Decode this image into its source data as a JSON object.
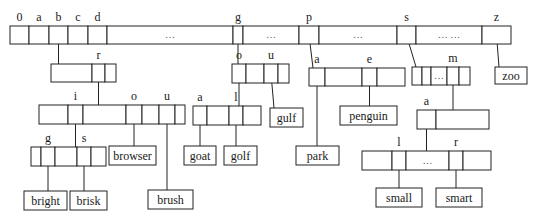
{
  "diagram": {
    "type": "trie",
    "colors": {
      "line": "#222222",
      "text": "#1a1a1a",
      "background": "#ffffff"
    },
    "root": {
      "x": 10,
      "y": 26,
      "h": 18,
      "cells": [
        {
          "label": "0",
          "w": 19
        },
        {
          "label": "a",
          "w": 20
        },
        {
          "label": "b",
          "w": 19,
          "pointer": true
        },
        {
          "label": "c",
          "w": 20
        },
        {
          "label": "d",
          "w": 19
        },
        {
          "label": "",
          "w": 126,
          "dots": "…"
        },
        {
          "label": "g",
          "w": 10,
          "pointer": true
        },
        {
          "label": "",
          "w": 56,
          "dots": "…"
        },
        {
          "label": "p",
          "w": 20,
          "pointer": true
        },
        {
          "label": "",
          "w": 78,
          "dots": "…"
        },
        {
          "label": "s",
          "w": 19,
          "pointer": true
        },
        {
          "label": "",
          "w": 66,
          "dots": "… …"
        },
        {
          "label": "z",
          "w": 29,
          "pointer": true
        }
      ]
    },
    "nodes": [
      {
        "id": "b",
        "x": 51,
        "y": 64,
        "h": 18,
        "cells": [
          {
            "label": "",
            "w": 41
          },
          {
            "label": "r",
            "w": 13,
            "pointer": true
          },
          {
            "label": "",
            "w": 11
          }
        ]
      },
      {
        "id": "br",
        "x": 39,
        "y": 105,
        "h": 19,
        "cells": [
          {
            "label": "",
            "w": 29
          },
          {
            "label": "i",
            "w": 15,
            "pointer": true
          },
          {
            "label": "",
            "w": 43
          },
          {
            "label": "o",
            "w": 16,
            "pointer": true
          },
          {
            "label": "",
            "w": 17
          },
          {
            "label": "u",
            "w": 16,
            "pointer": true
          },
          {
            "label": "",
            "w": 10
          }
        ]
      },
      {
        "id": "bri",
        "x": 31,
        "y": 147,
        "h": 19,
        "cells": [
          {
            "label": "",
            "w": 10
          },
          {
            "label": "g",
            "w": 14,
            "pointer": true
          },
          {
            "label": "",
            "w": 22
          },
          {
            "label": "s",
            "w": 14,
            "pointer": true
          },
          {
            "label": "",
            "w": 15
          }
        ]
      },
      {
        "id": "g",
        "x": 232,
        "y": 64,
        "h": 19,
        "cells": [
          {
            "label": "o",
            "w": 14,
            "pointer": true
          },
          {
            "label": "",
            "w": 18
          },
          {
            "label": "u",
            "w": 14,
            "pointer": true
          },
          {
            "label": "",
            "w": 11
          }
        ]
      },
      {
        "id": "go",
        "x": 193,
        "y": 106,
        "h": 19,
        "cells": [
          {
            "label": "a",
            "w": 14,
            "pointer": true
          },
          {
            "label": "",
            "w": 22
          },
          {
            "label": "l",
            "w": 14,
            "pointer": true
          },
          {
            "label": "",
            "w": 18
          }
        ]
      },
      {
        "id": "p",
        "x": 309,
        "y": 68,
        "h": 18,
        "cells": [
          {
            "label": "a",
            "w": 16,
            "pointer": true
          },
          {
            "label": "",
            "w": 37
          },
          {
            "label": "e",
            "w": 15,
            "pointer": true
          },
          {
            "label": "",
            "w": 28
          }
        ]
      },
      {
        "id": "s",
        "x": 412,
        "y": 67,
        "h": 18,
        "cells": [
          {
            "label": "",
            "w": 10,
            "pointer": true
          },
          {
            "label": "",
            "w": 9
          },
          {
            "label": "",
            "w": 16,
            "dots": "…"
          },
          {
            "label": "m",
            "w": 12,
            "pointer": true
          },
          {
            "label": "",
            "w": 11
          }
        ]
      },
      {
        "id": "sm",
        "x": 417,
        "y": 110,
        "h": 19,
        "cells": [
          {
            "label": "a",
            "w": 19,
            "pointer": true
          },
          {
            "label": "",
            "w": 53
          }
        ]
      },
      {
        "id": "sma",
        "x": 362,
        "y": 151,
        "h": 19,
        "cells": [
          {
            "label": "",
            "w": 30
          },
          {
            "label": "l",
            "w": 14,
            "pointer": true
          },
          {
            "label": "",
            "w": 43,
            "dots": "…"
          },
          {
            "label": "r",
            "w": 14,
            "pointer": true
          },
          {
            "label": "",
            "w": 28
          }
        ]
      }
    ],
    "leaves": [
      {
        "word": "bright",
        "x": 24,
        "y": 191,
        "w": 43,
        "h": 19
      },
      {
        "word": "brisk",
        "x": 70,
        "y": 191,
        "w": 37,
        "h": 19
      },
      {
        "word": "browser",
        "x": 109,
        "y": 146,
        "w": 47,
        "h": 19
      },
      {
        "word": "brush",
        "x": 148,
        "y": 190,
        "w": 45,
        "h": 19
      },
      {
        "word": "goat",
        "x": 184,
        "y": 146,
        "w": 32,
        "h": 19
      },
      {
        "word": "golf",
        "x": 224,
        "y": 146,
        "w": 33,
        "h": 19
      },
      {
        "word": "gulf",
        "x": 270,
        "y": 108,
        "w": 33,
        "h": 19
      },
      {
        "word": "park",
        "x": 296,
        "y": 146,
        "w": 43,
        "h": 19
      },
      {
        "word": "penguin",
        "x": 340,
        "y": 106,
        "w": 57,
        "h": 19
      },
      {
        "word": "small",
        "x": 376,
        "y": 188,
        "w": 46,
        "h": 19
      },
      {
        "word": "smart",
        "x": 436,
        "y": 188,
        "w": 46,
        "h": 19
      },
      {
        "word": "zoo",
        "x": 495,
        "y": 67,
        "w": 32,
        "h": 17
      }
    ],
    "edges": [
      {
        "from": "root.2",
        "to": "node:b"
      },
      {
        "from": "b.1",
        "to": "node:br"
      },
      {
        "from": "br.1",
        "to": "node:bri"
      },
      {
        "from": "br.3",
        "to": "leaf:browser"
      },
      {
        "from": "br.5",
        "to": "leaf:brush"
      },
      {
        "from": "bri.1",
        "to": "leaf:bright"
      },
      {
        "from": "bri.3",
        "to": "leaf:brisk"
      },
      {
        "from": "root.6",
        "to": "node:g"
      },
      {
        "from": "g.0",
        "to": "node:go"
      },
      {
        "from": "g.2",
        "to": "leaf:gulf"
      },
      {
        "from": "go.0",
        "to": "leaf:goat"
      },
      {
        "from": "go.2",
        "to": "leaf:golf"
      },
      {
        "from": "root.8",
        "to": "node:p"
      },
      {
        "from": "p.0",
        "to": "leaf:park"
      },
      {
        "from": "p.2",
        "to": "leaf:penguin"
      },
      {
        "from": "root.10",
        "to": "node:s"
      },
      {
        "from": "s.3",
        "to": "node:sm"
      },
      {
        "from": "sm.0",
        "to": "node:sma"
      },
      {
        "from": "sma.1",
        "to": "leaf:small"
      },
      {
        "from": "sma.3",
        "to": "leaf:smart"
      },
      {
        "from": "root.12",
        "to": "leaf:zoo"
      }
    ]
  }
}
